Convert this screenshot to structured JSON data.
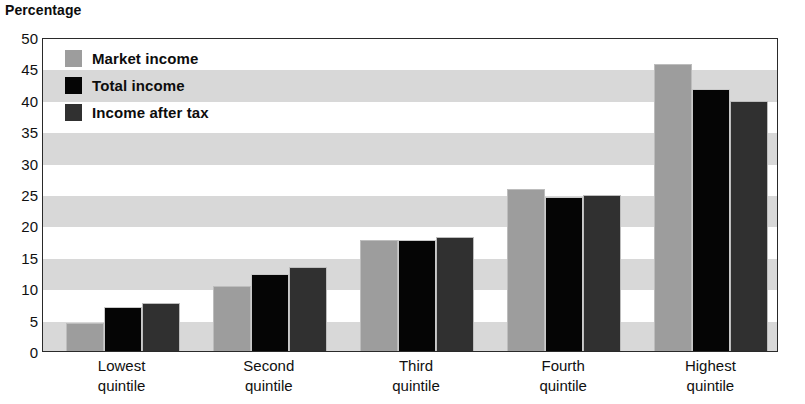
{
  "chart_data": {
    "type": "bar",
    "title": "Percentage",
    "xlabel": "",
    "ylabel": "Percentage",
    "ylim": [
      0,
      50
    ],
    "yticks": [
      50,
      45,
      40,
      35,
      30,
      25,
      20,
      15,
      10,
      5,
      0
    ],
    "grid": "alternating horizontal bands every 5 units",
    "legend_position": "top-left inside plot",
    "categories": [
      "Lowest\nquintile",
      "Second\nquintile",
      "Third\nquintile",
      "Fourth\nquintile",
      "Highest\nquintile"
    ],
    "category_lines": [
      [
        "Lowest",
        "quintile"
      ],
      [
        "Second",
        "quintile"
      ],
      [
        "Third",
        "quintile"
      ],
      [
        "Fourth",
        "quintile"
      ],
      [
        "Highest",
        "quintile"
      ]
    ],
    "series": [
      {
        "name": "Market income",
        "color": "#9d9d9d",
        "values": [
          4.5,
          10.3,
          17.7,
          25.8,
          45.7
        ]
      },
      {
        "name": "Total income",
        "color": "#050505",
        "values": [
          7.0,
          12.2,
          17.6,
          24.6,
          41.8
        ]
      },
      {
        "name": "Income after tax",
        "color": "#303030",
        "values": [
          7.7,
          13.4,
          18.2,
          24.8,
          39.8
        ]
      }
    ]
  },
  "legend": {
    "items": [
      {
        "label": "Market income"
      },
      {
        "label": "Total income"
      },
      {
        "label": "Income after tax"
      }
    ]
  }
}
